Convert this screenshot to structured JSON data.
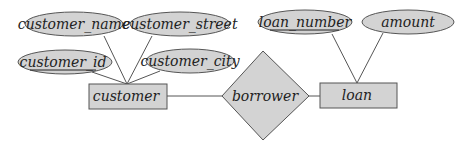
{
  "diagram": {
    "type": "entity-relationship",
    "colors": {
      "fill": "#d3d3d3",
      "stroke": "#555555",
      "text": "#222222",
      "background": "#ffffff"
    },
    "entities": [
      {
        "id": "customer",
        "label": "customer"
      },
      {
        "id": "loan",
        "label": "loan"
      }
    ],
    "relationships": [
      {
        "id": "borrower",
        "label": "borrower",
        "connects": [
          "customer",
          "loan"
        ]
      }
    ],
    "attributes": [
      {
        "id": "customer_name",
        "label": "customer_name",
        "entity": "customer",
        "key": false
      },
      {
        "id": "customer_street",
        "label": "customer_street",
        "entity": "customer",
        "key": false
      },
      {
        "id": "customer_id",
        "label": "customer_id",
        "entity": "customer",
        "key": true
      },
      {
        "id": "customer_city",
        "label": "customer_city",
        "entity": "customer",
        "key": false
      },
      {
        "id": "loan_number",
        "label": "loan_number",
        "entity": "loan",
        "key": true
      },
      {
        "id": "amount",
        "label": "amount",
        "entity": "loan",
        "key": false
      }
    ]
  }
}
